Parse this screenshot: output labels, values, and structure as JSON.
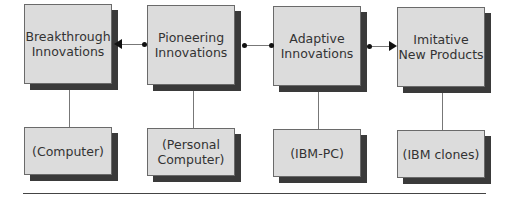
{
  "diagram": {
    "stages": [
      {
        "label": "Breakthrough\nInnovations",
        "example": "(Computer)"
      },
      {
        "label": "Pioneering\nInnovations",
        "example": "(Personal\nComputer)"
      },
      {
        "label": "Adaptive\nInnovations",
        "example": "(IBM-PC)"
      },
      {
        "label": "Imitative\nNew Products",
        "example": "(IBM clones)"
      }
    ],
    "connectors": [
      {
        "from": "Pioneering Innovations",
        "to": "Breakthrough Innovations",
        "type": "arrow"
      },
      {
        "from": "Pioneering Innovations",
        "to": "Adaptive Innovations",
        "type": "line"
      },
      {
        "from": "Adaptive Innovations",
        "to": "Imitative New Products",
        "type": "arrow"
      }
    ]
  },
  "colors": {
    "box_fill": "#dcdcdc",
    "box_shadow": "#3a3a3a",
    "line": "#777777"
  }
}
